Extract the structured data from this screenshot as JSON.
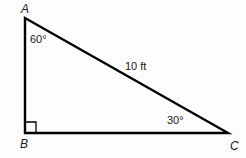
{
  "figure": {
    "type": "right-triangle-diagram",
    "background_color": "#fdfdfd",
    "stroke_color": "#000000",
    "text_color": "#1a1a1a",
    "vertices": {
      "A": {
        "label": "A",
        "x": 25,
        "y": 18
      },
      "B": {
        "label": "B",
        "x": 25,
        "y": 133
      },
      "C": {
        "label": "C",
        "x": 228,
        "y": 133
      }
    },
    "angles": {
      "at_A": "60°",
      "at_B": "90°",
      "at_C": "30°"
    },
    "sides": {
      "hypotenuse_AC": "10 ft"
    },
    "right_angle_marker": {
      "at_vertex": "B",
      "size": 11
    }
  }
}
